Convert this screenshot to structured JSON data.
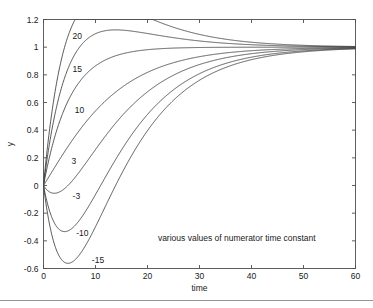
{
  "chart_data": {
    "type": "line",
    "title": "",
    "xlabel": "time",
    "ylabel": "y",
    "xlim": [
      0,
      60
    ],
    "ylim": [
      -0.6,
      1.2
    ],
    "xticks": [
      0,
      10,
      20,
      30,
      40,
      50,
      60
    ],
    "xticklabels": [
      "0",
      "10",
      "20",
      "30",
      "40",
      "50",
      "60"
    ],
    "yticks": [
      -0.6,
      -0.4,
      -0.2,
      0,
      0.2,
      0.4,
      0.6,
      0.8,
      1,
      1.2
    ],
    "yticklabels": [
      "-0.6",
      "-0.4",
      "-0.2",
      "0",
      "0.2",
      "0.4",
      "0.6",
      "0.8",
      "1",
      "1.2"
    ],
    "grid": false,
    "legend": "none",
    "annotation": "various values of numerator time constant",
    "annotation_xy": [
      22,
      -0.38
    ],
    "model": {
      "description": "step response of (tau_n*s + 1) / ((10*s + 1)*(5*s + 1))",
      "tau1": 10,
      "tau2": 5
    },
    "series": [
      {
        "name": "20",
        "tau_n": 20,
        "label": "20",
        "label_xy": [
          5.6,
          1.08
        ],
        "peak": {
          "t": 10.2,
          "y": 1.16
        },
        "final_value": 1.0
      },
      {
        "name": "15",
        "tau_n": 15,
        "label": "15",
        "label_xy": [
          5.6,
          0.845
        ],
        "peak": {
          "t": 20.0,
          "y": 1.0
        },
        "final_value": 1.0
      },
      {
        "name": "10",
        "tau_n": 10,
        "label": "10",
        "label_xy": [
          6.0,
          0.545
        ],
        "peak": {
          "t": 60.0,
          "y": 1.0
        },
        "final_value": 1.0
      },
      {
        "name": "3",
        "tau_n": 3,
        "label": "3",
        "label_xy": [
          5.4,
          0.175
        ],
        "peak": {
          "t": 60.0,
          "y": 1.0
        },
        "final_value": 1.0
      },
      {
        "name": "-3",
        "tau_n": -3,
        "label": "-3",
        "label_xy": [
          5.6,
          -0.075
        ],
        "minimum": {
          "t": 1.8,
          "y": -0.05
        },
        "final_value": 1.0
      },
      {
        "name": "-10",
        "tau_n": -10,
        "label": "-10",
        "label_xy": [
          6.3,
          -0.345
        ],
        "minimum": {
          "t": 3.1,
          "y": -0.31
        },
        "final_value": 1.0
      },
      {
        "name": "-15",
        "tau_n": -15,
        "label": "-15",
        "label_xy": [
          9.3,
          -0.535
        ],
        "minimum": {
          "t": 3.9,
          "y": -0.52
        },
        "final_value": 1.0
      }
    ],
    "colors": {
      "curve": "#3a3a3a",
      "axis": "#4d4d4d",
      "text": "#1a1a1a",
      "background": "#ffffff"
    }
  }
}
